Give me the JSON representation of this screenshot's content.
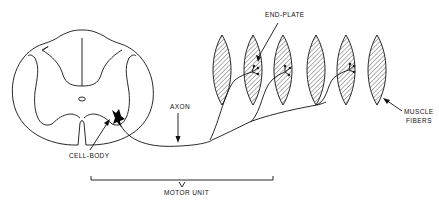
{
  "diagram": {
    "type": "motor-unit-anatomy",
    "labels": {
      "end_plate": "END-PLATE",
      "axon": "AXON",
      "cell_body": "CELL-BODY",
      "muscle_fibers_line1": "MUSCLE",
      "muscle_fibers_line2": "FIBERS",
      "motor_unit": "MOTOR UNIT"
    },
    "components": [
      "spinal-cord-cross-section",
      "motor-neuron-cell-body",
      "axon",
      "end-plates",
      "muscle-fibers",
      "motor-unit-bracket"
    ],
    "muscle_fiber_count": 6,
    "innervated_fiber_count": 3,
    "colors": {
      "ink": "#111111",
      "background": "#ffffff"
    }
  }
}
